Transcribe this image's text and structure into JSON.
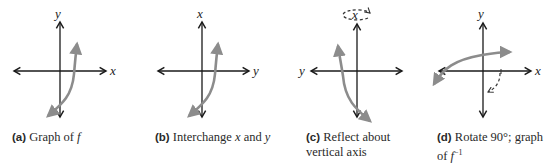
{
  "figure": {
    "panels": [
      {
        "id": "a",
        "tag": "(a)",
        "caption_lines": [
          "Graph of ",
          "f"
        ],
        "caption_text": "Graph of f",
        "vertical_axis_label": "y",
        "horizontal_axis_label": "x",
        "horizontal_label_side": "right"
      },
      {
        "id": "b",
        "tag": "(b)",
        "caption_text": "Interchange x and y",
        "caption_parts": [
          "Interchange ",
          "x",
          " and ",
          "y"
        ],
        "vertical_axis_label": "x",
        "horizontal_axis_label": "y",
        "horizontal_label_side": "right"
      },
      {
        "id": "c",
        "tag": "(c)",
        "caption_line1": "Reflect about",
        "caption_line2": "vertical axis",
        "vertical_axis_label": "x",
        "horizontal_axis_label": "y",
        "horizontal_label_side": "left",
        "annotation": "dashed rotation ellipse around vertical axis"
      },
      {
        "id": "d",
        "tag": "(d)",
        "caption_line1": "Rotate 90°; graph",
        "caption_line2_prefix": "of ",
        "caption_line2_func": "f",
        "caption_line2_sup": "−1",
        "vertical_axis_label": "y",
        "horizontal_axis_label": "x",
        "horizontal_label_side": "right",
        "annotation": "dashed clockwise rotation arc"
      }
    ],
    "colors": {
      "axis": "#1a1a1a",
      "curve": "#8c8c8c",
      "dashed": "#333333",
      "text": "#2a2a2a"
    }
  }
}
